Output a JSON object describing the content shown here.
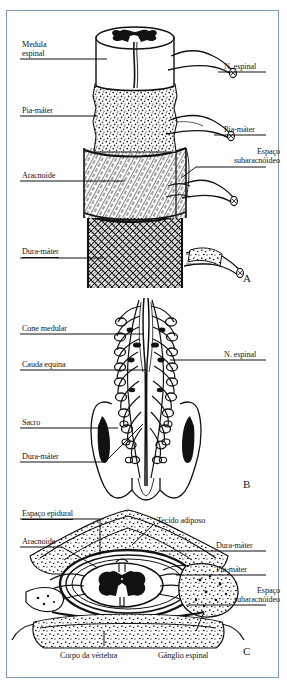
{
  "figure": {
    "language": "pt-BR",
    "frame_color": "#7d9bb5",
    "ink_color": "#111111",
    "panels": [
      "A",
      "B",
      "C"
    ]
  },
  "panel_a": {
    "letter": "A",
    "caption": "Medula espinal com meninges em corte, vista oblíqua",
    "labels": {
      "medula_espinal_l1": "Medula",
      "medula_espinal_l2": "espinal",
      "pia_mater_left": "Pia-máter",
      "aracnoide": "Aracnoide",
      "dura_mater": "Dura-máter",
      "nervo_espinal": "N. espinal",
      "pia_mater_right": "Pia-máter",
      "espaco_subaracnoideo_l1": "Espaço",
      "espaco_subaracnoideo_l2": "subaracnóideo"
    }
  },
  "panel_b": {
    "letter": "B",
    "caption": "Cone medular, cauda equina e sacro, vista posterior",
    "labels": {
      "cone_medular": "Cone medular",
      "cauda_equina": "Cauda equina",
      "sacro": "Sacro",
      "dura_mater": "Dura-máter",
      "nervo_espinal": "N. espinal"
    }
  },
  "panel_c": {
    "letter": "C",
    "caption": "Corte transversal da coluna vertebral e medula espinal",
    "labels": {
      "espaco_epidural": "Espaço epidural",
      "aracnoide": "Aracnoide",
      "tecido_adiposo": "Tecido adiposo",
      "dura_mater": "Dura-máter",
      "pia_mater": "Pia-máter",
      "espaco_subaracnoideo_l1": "Espaço",
      "espaco_subaracnoideo_l2": "subaracnóideo",
      "corpo_da_vertebra": "Corpo da vértebra",
      "ganglio_espinal": "Gânglio espinal"
    }
  }
}
